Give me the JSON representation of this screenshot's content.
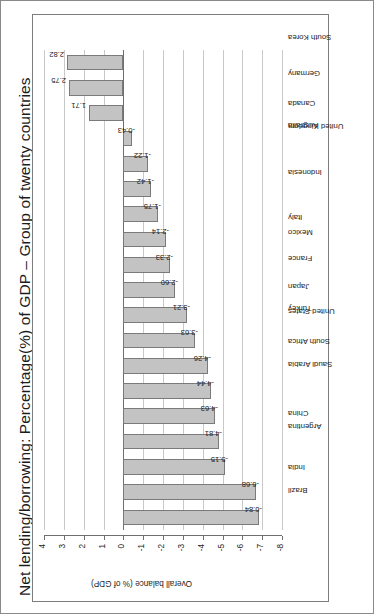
{
  "page": {
    "title": "Net lending/borrowing: Percentage(%) of GDP – Group of twenty countries",
    "year_annotation": "2018",
    "axis_title": "Overall balance (% of GDP)"
  },
  "colors": {
    "bar_fill": "#c3c3c3",
    "bar_border": "#7a7a7a",
    "gridline": "#c9c9c9",
    "zero_line": "#6f6f6f",
    "frame": "#7d7d7d",
    "text": "#222222",
    "page_border": "#8a8a8a",
    "background": "#ffffff"
  },
  "chart_data": {
    "type": "bar",
    "title": "Net lending/borrowing: Percentage(%) of GDP – Group of twenty countries",
    "subtitle": "2018",
    "xlabel": "",
    "ylabel": "Overall balance (% of GDP)",
    "ylim": [
      -8,
      4
    ],
    "yticks": [
      -8,
      -7,
      -6,
      -5,
      -4,
      -3,
      -2,
      -1,
      0,
      1,
      2,
      3,
      4
    ],
    "ytick_labels": [
      "-8",
      "-7",
      "-6",
      "-5",
      "-4",
      "-3",
      "-2",
      "-1",
      "0",
      "1",
      "2",
      "3",
      "4"
    ],
    "grid": true,
    "legend": false,
    "orientation": "vertical-bars-on-rotated-page",
    "categories": [
      "Brazil",
      "India",
      "Argentina",
      "China",
      "Saudi Arabia",
      "South Africa",
      "United States",
      "Turkey",
      "Japan",
      "France",
      "Mexico",
      "Italy",
      "Indonesia",
      "United Kingdom",
      "Australia",
      "Canada",
      "Germany",
      "South Korea",
      "Russian Federation"
    ],
    "values": [
      -6.84,
      -6.68,
      -5.15,
      -4.81,
      -4.63,
      -4.44,
      -4.26,
      -3.63,
      -3.21,
      -2.6,
      -2.33,
      -2.14,
      -1.75,
      -1.42,
      -1.22,
      -0.43,
      1.71,
      2.75,
      2.82
    ],
    "value_labels": [
      "-6.84",
      "-6.68",
      "-5.15",
      "-4.81",
      "-4.63",
      "-4.44",
      "-4.26",
      "-3.63",
      "-3.21",
      "-2.60",
      "-2.33",
      "-2.14",
      "-1.75",
      "-1.42",
      "-1.22",
      "-0.43",
      "1.71",
      "2.75",
      "2.82"
    ]
  }
}
